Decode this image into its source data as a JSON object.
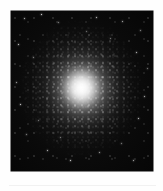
{
  "figure": {
    "name": "globular-cluster-plate",
    "caption": "",
    "background_color": "#050505",
    "page_background": "#ffffff",
    "rule_color": "#f1f1f1",
    "frame": {
      "x": 11,
      "y": 11,
      "width": 142,
      "height": 160
    }
  },
  "sky_image": {
    "object_type": "globular cluster",
    "core_color": "#ffffff",
    "halo_color": "#c8c8c8",
    "sky_color": "#050505",
    "core_center": {
      "x": 78,
      "y": 86
    },
    "halo_radius_px": 63,
    "core_radius_px": 23
  },
  "field_stars": [
    {
      "x": 24,
      "y": 18,
      "size": 1.0,
      "brightness": 0.75
    },
    {
      "x": 41,
      "y": 14,
      "size": 1.4,
      "brightness": 0.92
    },
    {
      "x": 58,
      "y": 22,
      "size": 0.9,
      "brightness": 0.6
    },
    {
      "x": 96,
      "y": 17,
      "size": 1.1,
      "brightness": 0.8
    },
    {
      "x": 122,
      "y": 21,
      "size": 1.0,
      "brightness": 0.7
    },
    {
      "x": 140,
      "y": 30,
      "size": 0.9,
      "brightness": 0.62
    },
    {
      "x": 18,
      "y": 44,
      "size": 1.2,
      "brightness": 0.85
    },
    {
      "x": 33,
      "y": 57,
      "size": 0.9,
      "brightness": 0.58
    },
    {
      "x": 136,
      "y": 52,
      "size": 1.1,
      "brightness": 0.78
    },
    {
      "x": 147,
      "y": 68,
      "size": 0.9,
      "brightness": 0.55
    },
    {
      "x": 16,
      "y": 82,
      "size": 1.0,
      "brightness": 0.68
    },
    {
      "x": 20,
      "y": 104,
      "size": 1.3,
      "brightness": 0.88
    },
    {
      "x": 144,
      "y": 96,
      "size": 1.0,
      "brightness": 0.72
    },
    {
      "x": 138,
      "y": 118,
      "size": 1.2,
      "brightness": 0.82
    },
    {
      "x": 26,
      "y": 134,
      "size": 0.9,
      "brightness": 0.6
    },
    {
      "x": 47,
      "y": 150,
      "size": 1.1,
      "brightness": 0.76
    },
    {
      "x": 70,
      "y": 160,
      "size": 1.3,
      "brightness": 0.9
    },
    {
      "x": 99,
      "y": 152,
      "size": 1.0,
      "brightness": 0.66
    },
    {
      "x": 121,
      "y": 143,
      "size": 0.9,
      "brightness": 0.58
    },
    {
      "x": 133,
      "y": 160,
      "size": 1.0,
      "brightness": 0.7
    },
    {
      "x": 86,
      "y": 31,
      "size": 0.8,
      "brightness": 0.5
    },
    {
      "x": 110,
      "y": 38,
      "size": 0.9,
      "brightness": 0.55
    },
    {
      "x": 38,
      "y": 120,
      "size": 0.8,
      "brightness": 0.52
    },
    {
      "x": 60,
      "y": 137,
      "size": 0.9,
      "brightness": 0.58
    }
  ]
}
